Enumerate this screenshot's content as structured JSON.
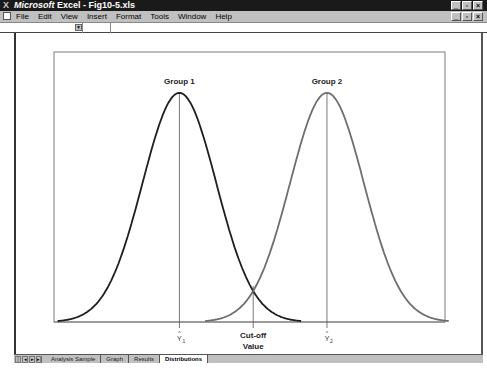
{
  "window": {
    "app_name": "Microsoft",
    "title_rest": " Excel - Fig10-5.xls",
    "buttons": {
      "minimize": "_",
      "restore": "▫",
      "close": "×"
    }
  },
  "menu": {
    "items": [
      "File",
      "Edit",
      "View",
      "Insert",
      "Format",
      "Tools",
      "Window",
      "Help"
    ]
  },
  "formula_bar": {
    "name_box": "",
    "formula": ""
  },
  "sheet_tabs": {
    "nav": [
      "|◂",
      "◂",
      "▸",
      "▸|"
    ],
    "tabs": [
      {
        "label": "Analysis Sample",
        "active": false
      },
      {
        "label": "Graph",
        "active": false
      },
      {
        "label": "Results",
        "active": false
      },
      {
        "label": "Distributions",
        "active": true
      }
    ]
  },
  "chart_data": {
    "type": "line",
    "title": "",
    "xlabel": "",
    "ylabel": "",
    "grid": false,
    "legend": "none",
    "series": [
      {
        "name": "Group 1",
        "distribution": "normal",
        "mean": 0,
        "sd": 1,
        "color": "#1e1e1e"
      },
      {
        "name": "Group 2",
        "distribution": "normal",
        "mean": 4,
        "sd": 1,
        "color": "#6e6e6e"
      }
    ],
    "xlim": [
      -3.4,
      7.2
    ],
    "ylim": [
      0,
      0.47
    ],
    "annotations": {
      "group1_label": "Group 1",
      "group2_label": "Group 2",
      "centroid1_hat": "^",
      "centroid1_sym": "Y",
      "centroid1_sub": "1",
      "centroid2_hat": "^",
      "centroid2_sym": "Y",
      "centroid2_sub": "2",
      "cutoff_line1": "Cut-off",
      "cutoff_line2": "Value",
      "cutoff_x": 2
    }
  }
}
